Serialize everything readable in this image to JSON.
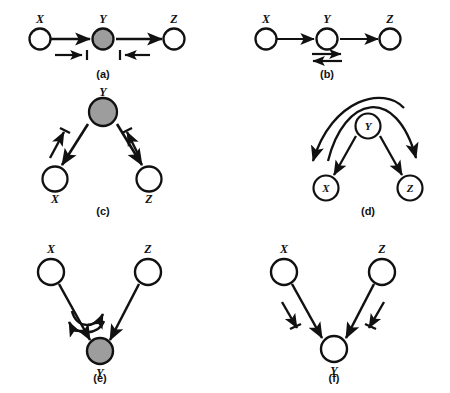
{
  "figure": {
    "background_color": "#ffffff",
    "ink_color": "#111111",
    "shaded_node_color": "#9d9d9d",
    "open_node_color": "#ffffff",
    "node_labels": [
      "X",
      "Y",
      "Z"
    ],
    "panel_count": 6
  },
  "panels": [
    {
      "id": "a",
      "caption": "(a)",
      "layout": "horizontal-chain",
      "nodes": [
        {
          "name": "X",
          "label": "X",
          "shaded": false,
          "label_position": "above"
        },
        {
          "name": "Y",
          "label": "Y",
          "shaded": true,
          "label_position": "above"
        },
        {
          "name": "Z",
          "label": "Z",
          "shaded": false,
          "label_position": "above"
        }
      ],
      "edges": [
        {
          "from": "X",
          "to": "Y",
          "style": "solid",
          "arrow": "to"
        },
        {
          "from": "Y",
          "to": "Z",
          "style": "solid",
          "arrow": "to"
        }
      ],
      "markers": [
        {
          "name": "flow-marker-left",
          "direction": "right",
          "under": "X-Y"
        },
        {
          "name": "flow-marker-right",
          "direction": "left",
          "under": "Y-Z"
        }
      ]
    },
    {
      "id": "b",
      "caption": "(b)",
      "layout": "horizontal-chain",
      "nodes": [
        {
          "name": "X",
          "label": "X",
          "shaded": false,
          "label_position": "above"
        },
        {
          "name": "Y",
          "label": "Y",
          "shaded": false,
          "label_position": "above"
        },
        {
          "name": "Z",
          "label": "Z",
          "shaded": false,
          "label_position": "above"
        }
      ],
      "edges": [
        {
          "from": "X",
          "to": "Y",
          "style": "solid",
          "arrow": "to"
        },
        {
          "from": "Y",
          "to": "Z",
          "style": "solid",
          "arrow": "to"
        }
      ],
      "markers": [
        {
          "name": "double-arrow-marker",
          "direction": "bidirectional",
          "under": "Y"
        }
      ]
    },
    {
      "id": "c",
      "caption": "(c)",
      "layout": "fork-down",
      "nodes": [
        {
          "name": "Y",
          "label": "Y",
          "shaded": true,
          "label_position": "above"
        },
        {
          "name": "X",
          "label": "X",
          "shaded": false,
          "label_position": "below"
        },
        {
          "name": "Z",
          "label": "Z",
          "shaded": false,
          "label_position": "below"
        }
      ],
      "edges": [
        {
          "from": "Y",
          "to": "X",
          "style": "solid",
          "arrow": "to"
        },
        {
          "from": "Y",
          "to": "Z",
          "style": "solid",
          "arrow": "to"
        }
      ],
      "markers": [
        {
          "name": "flow-marker-left",
          "direction": "up-toward-Y",
          "beside": "Y-X"
        },
        {
          "name": "flow-marker-right",
          "direction": "up-toward-Y",
          "beside": "Y-Z"
        }
      ]
    },
    {
      "id": "d",
      "caption": "(d)",
      "layout": "fork-down-with-arcs",
      "nodes": [
        {
          "name": "Y",
          "label": "Y",
          "shaded": false,
          "label_position": "inside"
        },
        {
          "name": "X",
          "label": "X",
          "shaded": false,
          "label_position": "inside"
        },
        {
          "name": "Z",
          "label": "Z",
          "shaded": false,
          "label_position": "inside"
        }
      ],
      "edges": [
        {
          "from": "Y",
          "to": "X",
          "style": "solid",
          "arrow": "to"
        },
        {
          "from": "Y",
          "to": "Z",
          "style": "solid",
          "arrow": "to"
        }
      ],
      "markers": [
        {
          "name": "arc-marker-left",
          "direction": "down-left",
          "style": "curved-arc"
        },
        {
          "name": "arc-marker-right",
          "direction": "down-right",
          "style": "curved-arc"
        }
      ]
    },
    {
      "id": "e",
      "caption": "(e)",
      "layout": "collider-up",
      "nodes": [
        {
          "name": "X",
          "label": "X",
          "shaded": false,
          "label_position": "above"
        },
        {
          "name": "Z",
          "label": "Z",
          "shaded": false,
          "label_position": "above"
        },
        {
          "name": "Y",
          "label": "Y",
          "shaded": true,
          "label_position": "below"
        }
      ],
      "edges": [
        {
          "from": "X",
          "to": "Y",
          "style": "solid",
          "arrow": "to"
        },
        {
          "from": "Z",
          "to": "Y",
          "style": "solid",
          "arrow": "to"
        }
      ],
      "markers": [
        {
          "name": "curved-arc-marker-upper",
          "direction": "right",
          "style": "curved-arc"
        },
        {
          "name": "curved-arc-marker-lower",
          "direction": "left",
          "style": "curved-arc"
        }
      ]
    },
    {
      "id": "f",
      "caption": "(f)",
      "layout": "collider-up",
      "nodes": [
        {
          "name": "X",
          "label": "X",
          "shaded": false,
          "label_position": "above"
        },
        {
          "name": "Z",
          "label": "Z",
          "shaded": false,
          "label_position": "above"
        },
        {
          "name": "Y",
          "label": "Y",
          "shaded": false,
          "label_position": "below"
        }
      ],
      "edges": [
        {
          "from": "X",
          "to": "Y",
          "style": "solid",
          "arrow": "to"
        },
        {
          "from": "Z",
          "to": "Y",
          "style": "solid",
          "arrow": "to"
        }
      ],
      "markers": [
        {
          "name": "flow-marker-left",
          "direction": "down-toward-Y",
          "beside": "X-Y"
        },
        {
          "name": "flow-marker-right",
          "direction": "down-toward-Y",
          "beside": "Z-Y"
        }
      ]
    }
  ]
}
